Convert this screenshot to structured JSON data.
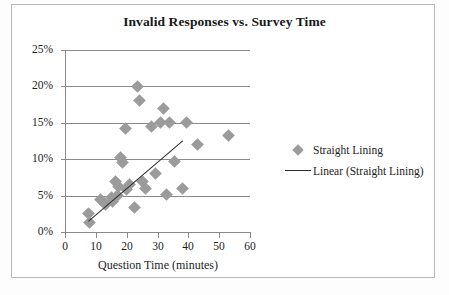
{
  "chart_data": {
    "type": "scatter",
    "title": "Invalid Responses vs. Survey Time",
    "xlabel": "Question Time (minutes)",
    "ylabel": "",
    "xlim": [
      0,
      60
    ],
    "ylim": [
      0,
      0.25
    ],
    "xticks": [
      "0",
      "10",
      "20",
      "30",
      "40",
      "50",
      "60"
    ],
    "xtick_values": [
      0,
      10,
      20,
      30,
      40,
      50,
      60
    ],
    "yticks": [
      "0%",
      "5%",
      "10%",
      "15%",
      "20%",
      "25%"
    ],
    "ytick_values": [
      0,
      0.05,
      0.1,
      0.15,
      0.2,
      0.25
    ],
    "grid": "horizontal",
    "legend_position": "right",
    "series": [
      {
        "name": "Straight Lining",
        "type": "scatter",
        "marker": "diamond",
        "color": "#9b9b9b",
        "points": [
          [
            7.5,
            2.5
          ],
          [
            8.0,
            1.3
          ],
          [
            11.5,
            4.5
          ],
          [
            13.0,
            3.8
          ],
          [
            15.0,
            4.8
          ],
          [
            15.5,
            4.2
          ],
          [
            16.5,
            7.0
          ],
          [
            17.0,
            5.0
          ],
          [
            17.5,
            6.2
          ],
          [
            18.0,
            10.3
          ],
          [
            18.5,
            9.5
          ],
          [
            19.5,
            14.2
          ],
          [
            20.0,
            5.8
          ],
          [
            21.0,
            6.5
          ],
          [
            22.5,
            3.3
          ],
          [
            23.5,
            20.0
          ],
          [
            24.0,
            18.0
          ],
          [
            25.0,
            7.0
          ],
          [
            26.0,
            6.0
          ],
          [
            28.0,
            14.5
          ],
          [
            29.5,
            8.0
          ],
          [
            31.0,
            15.0
          ],
          [
            32.0,
            17.0
          ],
          [
            33.0,
            5.2
          ],
          [
            34.0,
            15.0
          ],
          [
            35.5,
            9.7
          ],
          [
            38.0,
            6.0
          ],
          [
            39.5,
            15.0
          ],
          [
            43.0,
            12.0
          ],
          [
            53.0,
            13.3
          ]
        ]
      },
      {
        "name": "Linear (Straight Lining)",
        "type": "line",
        "color": "#2b2b2b",
        "endpoints": [
          [
            7.5,
            1.5
          ],
          [
            38.0,
            12.5
          ]
        ]
      }
    ]
  },
  "legend": {
    "items": [
      {
        "label": "Straight Lining",
        "key": "diamond-marker"
      },
      {
        "label": "Linear (Straight Lining)",
        "key": "trend-line"
      }
    ]
  }
}
